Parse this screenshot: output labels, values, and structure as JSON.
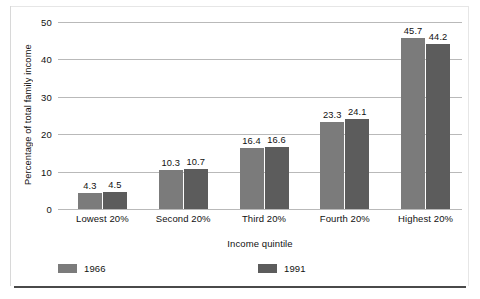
{
  "chart_data": {
    "type": "bar",
    "title": "",
    "subtitle": "",
    "xlabel": "Income quintile",
    "ylabel": "Percentage of total family income",
    "categories": [
      "Lowest 20%",
      "Second 20%",
      "Third 20%",
      "Fourth 20%",
      "Highest 20%"
    ],
    "series": [
      {
        "name": "1966",
        "color": "#7b7b7b",
        "values": [
          4.3,
          10.3,
          16.4,
          23.3,
          45.7
        ]
      },
      {
        "name": "1991",
        "color": "#5c5c5c",
        "values": [
          4.5,
          10.7,
          16.6,
          24.1,
          44.2
        ]
      }
    ],
    "value_labels": [
      [
        "4.3",
        "10.3",
        "16.4",
        "23.3",
        "45.7"
      ],
      [
        "4.5",
        "10.7",
        "16.6",
        "24.1",
        "44.2"
      ]
    ],
    "ylim": [
      0,
      50
    ],
    "yticks": [
      0,
      10,
      20,
      30,
      40,
      50
    ],
    "ytick_labels": [
      "0",
      "10",
      "20",
      "30",
      "40",
      "50"
    ],
    "grid": true,
    "grid_axis": "y",
    "legend_position": "bottom",
    "legend": [
      "1966",
      "1991"
    ],
    "bar_value_labels_shown": true,
    "background_color": "#ffffff",
    "gridline_color": "#b9b9b9",
    "text_color": "#111111"
  }
}
